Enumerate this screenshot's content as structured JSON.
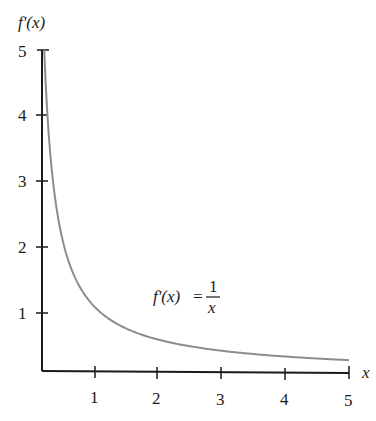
{
  "chart_data": {
    "type": "line",
    "title": "",
    "xlabel": "x",
    "ylabel": "f'(x)",
    "x_ticks": [
      1,
      2,
      3,
      4,
      5
    ],
    "y_ticks": [
      1,
      2,
      3,
      4,
      5
    ],
    "xlim": [
      0.2,
      5
    ],
    "ylim": [
      0,
      5
    ],
    "grid": false,
    "legend": null,
    "annotation": {
      "text": "f'(x) = 1/x",
      "lhs": "f'(x)",
      "eq": "=",
      "numerator": "1",
      "denominator": "x"
    },
    "series": [
      {
        "name": "f'(x) = 1/x",
        "color": "#8c8c8c",
        "x": [
          0.2,
          0.25,
          0.3,
          0.4,
          0.5,
          0.75,
          1,
          1.5,
          2,
          2.5,
          3,
          3.5,
          4,
          4.5,
          5
        ],
        "y": [
          5,
          4,
          3.33,
          2.5,
          2,
          1.33,
          1,
          0.67,
          0.5,
          0.4,
          0.33,
          0.29,
          0.25,
          0.22,
          0.2
        ]
      }
    ]
  },
  "labels": {
    "ylabel": "f'(x)",
    "xlabel": "x",
    "x_tick_labels": [
      "1",
      "2",
      "3",
      "4",
      "5"
    ],
    "y_tick_labels": [
      "1",
      "2",
      "3",
      "4",
      "5"
    ],
    "annot_lhs": "f'(x)",
    "annot_eq": "=",
    "annot_num": "1",
    "annot_den": "x"
  }
}
